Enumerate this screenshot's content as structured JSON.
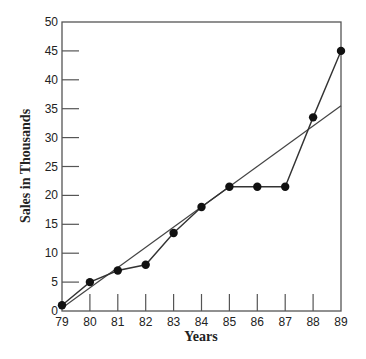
{
  "chart_data": {
    "type": "line",
    "title": "",
    "xlabel": "Years",
    "ylabel": "Sales in Thousands",
    "x": [
      79,
      80,
      81,
      82,
      83,
      84,
      85,
      86,
      87,
      88,
      89
    ],
    "series": [
      {
        "name": "Sales",
        "values": [
          1,
          5,
          7,
          8,
          13.5,
          18,
          21.5,
          21.5,
          21.5,
          33.5,
          45
        ],
        "markers": true
      },
      {
        "name": "Trend line",
        "values_at_endpoints": {
          "79": 0.5,
          "89": 35.5
        },
        "markers": false
      }
    ],
    "xlim": [
      79,
      89
    ],
    "ylim": [
      0,
      50
    ],
    "yticks": [
      0,
      5,
      10,
      15,
      20,
      25,
      30,
      35,
      40,
      45,
      50
    ],
    "xticks": [
      "79",
      "80",
      "81",
      "82",
      "83",
      "84",
      "85",
      "86",
      "87",
      "88",
      "89"
    ],
    "grid": false,
    "legend": null
  },
  "labels": {
    "x_axis": "Years",
    "y_axis": "Sales in Thousands"
  }
}
